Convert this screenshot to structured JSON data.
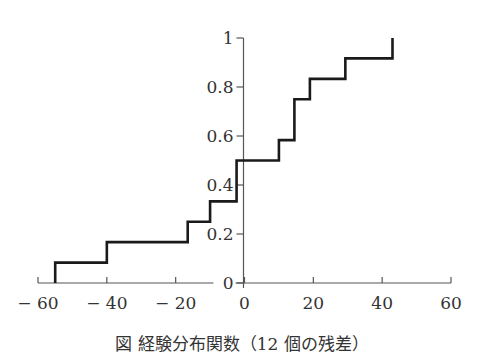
{
  "chart_data": {
    "type": "line",
    "subtype": "step (empirical distribution function)",
    "title": "",
    "caption": "図 経験分布関数（12 個の残差）",
    "xlabel": "",
    "ylabel": "",
    "xlim": [
      -60,
      60
    ],
    "ylim": [
      0,
      1
    ],
    "x_ticks": [
      -60,
      -40,
      -20,
      0,
      20,
      40,
      60
    ],
    "x_tick_labels": [
      "− 60",
      "− 40",
      "− 20",
      "0",
      "20",
      "40",
      "60"
    ],
    "y_ticks": [
      0,
      0.2,
      0.4,
      0.6,
      0.8,
      1
    ],
    "y_tick_labels": [
      "0",
      "0.2",
      "0.4",
      "0.6",
      "0.8",
      "1"
    ],
    "grid": false,
    "legend": null,
    "n": 12,
    "steps": [
      {
        "x": -55,
        "y": 0.083
      },
      {
        "x": -40,
        "y": 0.167
      },
      {
        "x": -16.5,
        "y": 0.25
      },
      {
        "x": -10,
        "y": 0.333
      },
      {
        "x": -2.3,
        "y": 0.5
      },
      {
        "x": 10,
        "y": 0.583
      },
      {
        "x": 14.5,
        "y": 0.75
      },
      {
        "x": 19,
        "y": 0.833
      },
      {
        "x": 29.3,
        "y": 0.917
      },
      {
        "x": 43,
        "y": 1.0
      }
    ],
    "line_color": "#1a1a1a"
  }
}
